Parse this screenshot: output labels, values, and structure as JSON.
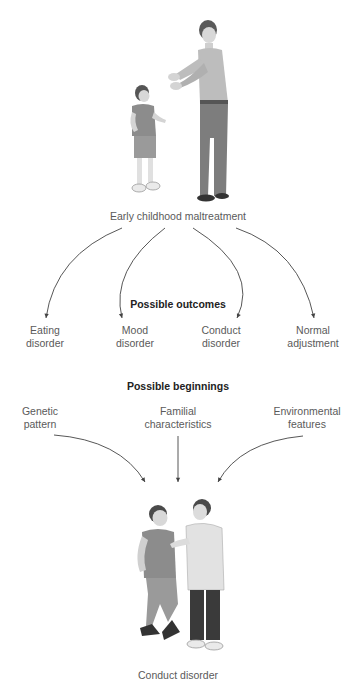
{
  "top": {
    "caption": "Early childhood maltreatment",
    "illustration": "adult-scolding-child"
  },
  "outcomes": {
    "heading": "Possible outcomes",
    "items": [
      {
        "label": "Eating\ndisorder"
      },
      {
        "label": "Mood\ndisorder"
      },
      {
        "label": "Conduct\ndisorder"
      },
      {
        "label": "Normal\nadjustment"
      }
    ]
  },
  "beginnings": {
    "heading": "Possible beginnings",
    "items": [
      {
        "label": "Genetic\npattern"
      },
      {
        "label": "Familial\ncharacteristics"
      },
      {
        "label": "Environmental\nfeatures"
      }
    ]
  },
  "bottom": {
    "caption": "Conduct disorder",
    "illustration": "two-boys-confrontation"
  },
  "colors": {
    "arrow": "#444444",
    "text": "#5a5a5a",
    "heading": "#222222"
  }
}
